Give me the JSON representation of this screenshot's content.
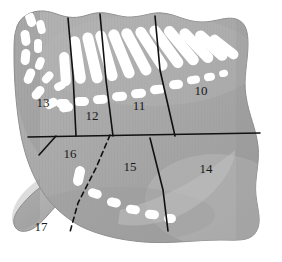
{
  "figure": {
    "type": "anatomical-region-diagram",
    "title": "",
    "background_color": "#ffffff",
    "body_fill": "#a6a6a6",
    "body_fill_light": "#b8b8b8",
    "body_fill_dark": "#949494",
    "marking_color": "#ffffff",
    "line_color": "#111111",
    "label_color": "#1a1a1a"
  },
  "regions": [
    {
      "id": "region-10",
      "label": "10",
      "x": 201,
      "y": 92
    },
    {
      "id": "region-11",
      "label": "11",
      "x": 139,
      "y": 107
    },
    {
      "id": "region-12",
      "label": "12",
      "x": 92,
      "y": 117
    },
    {
      "id": "region-13",
      "label": "13",
      "x": 43,
      "y": 104
    },
    {
      "id": "region-14",
      "label": "14",
      "x": 206,
      "y": 170
    },
    {
      "id": "region-15",
      "label": "15",
      "x": 130,
      "y": 168
    },
    {
      "id": "region-16",
      "label": "16",
      "x": 70,
      "y": 155
    },
    {
      "id": "region-17",
      "label": "17",
      "x": 41,
      "y": 228
    }
  ],
  "boundaries": {
    "solid": [
      {
        "id": "divider-13-12",
        "d": "M 68 18 L 73 75 L 76 136"
      },
      {
        "id": "divider-12-11",
        "d": "M 100 14 L 106 80 L 113 136"
      },
      {
        "id": "divider-11-10",
        "d": "M 155 16 L 160 70 L 175 136"
      },
      {
        "id": "divider-horizontal",
        "d": "M 28 137 L 140 135 L 260 133"
      },
      {
        "id": "divider-16-17",
        "d": "M 39 155 L 56 136"
      },
      {
        "id": "divider-15-14",
        "d": "M 150 138 L 163 190 L 168 231"
      }
    ],
    "dashed": [
      {
        "id": "divider-16-15",
        "d": "M 110 135 L 96 168 L 78 203 L 70 232"
      }
    ]
  }
}
